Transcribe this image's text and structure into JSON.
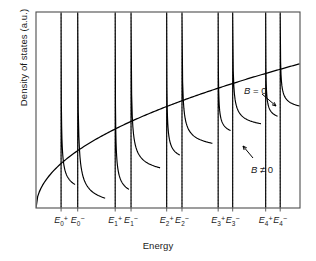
{
  "figure": {
    "xlabel": "Energy",
    "ylabel": "Density of states (a.u.)",
    "frame_color": "#4d4d4d",
    "curve_color": "#000000",
    "tick_line_color": "#808080"
  },
  "annotations": [
    {
      "name": "b-zero-label",
      "text": "B = 0",
      "x": 244,
      "y": 85
    },
    {
      "name": "b-nonzero-label",
      "text": "B ≠ 0",
      "x": 251,
      "y": 164
    }
  ],
  "chart_data": {
    "type": "line",
    "title": "",
    "xlabel": "Energy",
    "ylabel": "Density of states (a.u.)",
    "grid": false,
    "legend": [
      "B = 0",
      "B ≠ 0"
    ],
    "legend_position": "inside-right",
    "xlim": [
      0,
      1
    ],
    "ylim": [
      0,
      1
    ],
    "axis_tick_labels": [
      "E_0^+",
      "E_0^-",
      "E_1^+",
      "E_1^-",
      "E_2^+",
      "E_2^-",
      "E_3^+",
      "E_3^-",
      "E_4^+",
      "E_4^-"
    ],
    "tick_positions": [
      0.095,
      0.158,
      0.3,
      0.36,
      0.495,
      0.553,
      0.69,
      0.745,
      0.87,
      0.925
    ],
    "series": [
      {
        "name": "B = 0",
        "description": "smooth 3D free-electron density of states, proportional to sqrt(E)",
        "form": "sqrt",
        "x": [
          0.0,
          0.05,
          0.1,
          0.15,
          0.2,
          0.3,
          0.4,
          0.5,
          0.6,
          0.7,
          0.8,
          0.9,
          1.0
        ],
        "y": [
          0.0,
          0.165,
          0.233,
          0.285,
          0.329,
          0.403,
          0.465,
          0.52,
          0.57,
          0.616,
          0.658,
          0.698,
          0.736
        ]
      },
      {
        "name": "B ≠ 0",
        "description": "Landau-quantised density of states: inverse-square-root singularity at each level, sawtooth decay between levels",
        "form": "landau-sawtooth",
        "peaks": [
          {
            "label": "E_0^+",
            "x": 0.095,
            "decay_end_x": 0.148,
            "decay_end_y": 0.12
          },
          {
            "label": "E_0^-",
            "x": 0.158,
            "decay_end_x": 0.262,
            "decay_end_y": 0.05
          },
          {
            "label": "E_1^+",
            "x": 0.3,
            "decay_end_x": 0.352,
            "decay_end_y": 0.095
          },
          {
            "label": "E_1^-",
            "x": 0.36,
            "decay_end_x": 0.47,
            "decay_end_y": 0.205
          },
          {
            "label": "E_2^+",
            "x": 0.495,
            "decay_end_x": 0.545,
            "decay_end_y": 0.27
          },
          {
            "label": "E_2^-",
            "x": 0.553,
            "decay_end_x": 0.668,
            "decay_end_y": 0.33
          },
          {
            "label": "E_3^+",
            "x": 0.69,
            "decay_end_x": 0.737,
            "decay_end_y": 0.395
          },
          {
            "label": "E_3^-",
            "x": 0.745,
            "decay_end_x": 0.852,
            "decay_end_y": 0.43
          },
          {
            "label": "E_4^+",
            "x": 0.87,
            "decay_end_x": 0.915,
            "decay_end_y": 0.468
          },
          {
            "label": "E_4^-",
            "x": 0.925,
            "decay_end_x": 1.0,
            "decay_end_y": 0.52
          }
        ]
      }
    ]
  }
}
